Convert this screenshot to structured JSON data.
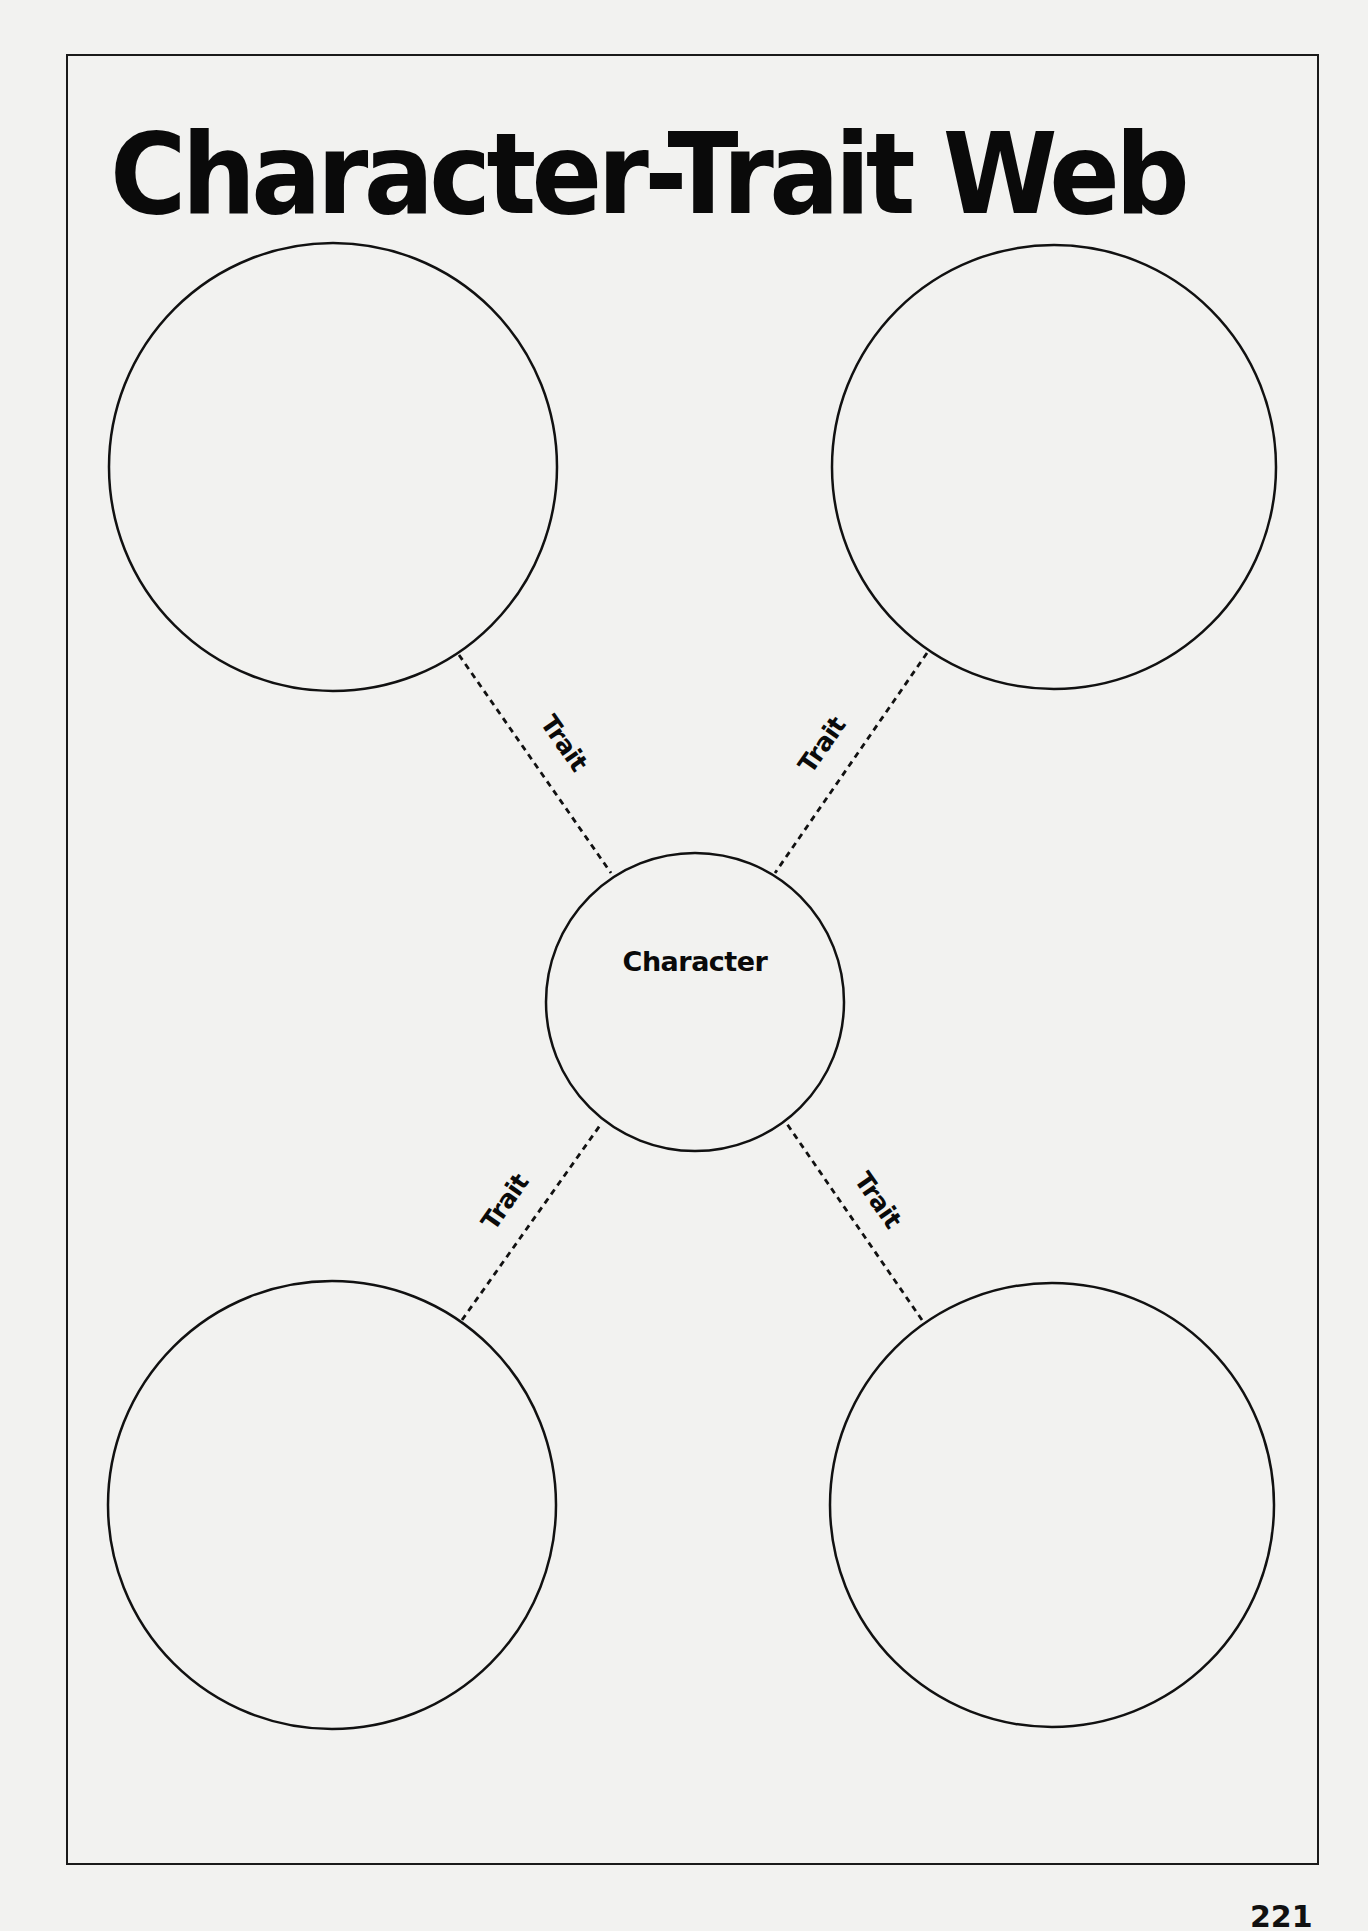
{
  "page": {
    "title": "Character-Trait Web",
    "page_number": "221",
    "background_color": "#f2f2f0",
    "ink_color": "#0a0a0a"
  },
  "web": {
    "center": {
      "label": "Character",
      "cx": 695,
      "cy": 1002,
      "r": 149
    },
    "outer_circles": [
      {
        "id": "top-left",
        "cx": 333,
        "cy": 467,
        "r": 224,
        "content": ""
      },
      {
        "id": "top-right",
        "cx": 1054,
        "cy": 467,
        "r": 222,
        "content": ""
      },
      {
        "id": "bottom-left",
        "cx": 332,
        "cy": 1505,
        "r": 224,
        "content": ""
      },
      {
        "id": "bottom-right",
        "cx": 1052,
        "cy": 1505,
        "r": 222,
        "content": ""
      }
    ],
    "connectors": [
      {
        "id": "top-left",
        "label": "Trait"
      },
      {
        "id": "top-right",
        "label": "Trait"
      },
      {
        "id": "bottom-left",
        "label": "Trait"
      },
      {
        "id": "bottom-right",
        "label": "Trait"
      }
    ]
  }
}
